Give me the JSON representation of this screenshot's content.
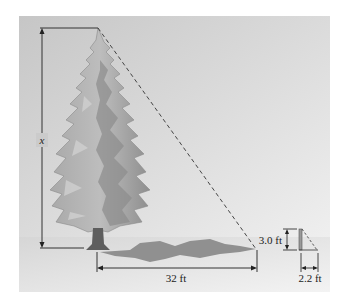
{
  "figure": {
    "type": "similar-triangles tree height diagram",
    "labels": {
      "tree_height": "x",
      "shadow_length": "32 ft",
      "stick_height": "3.0 ft",
      "stick_shadow": "2.2 ft"
    },
    "colors": {
      "sky_top": "#c9c9c9",
      "sky_bottom": "#ececec",
      "ground": "#d8d8d8",
      "shadow": "#8f8f8f",
      "tree_light": "#b4b4b4",
      "tree_dark": "#7d7d7d",
      "trunk": "#5e5e5e",
      "line": "#333333"
    },
    "values": {
      "shadow_ft": 32,
      "stick_ft": 3.0,
      "stick_shadow_ft": 2.2
    }
  }
}
